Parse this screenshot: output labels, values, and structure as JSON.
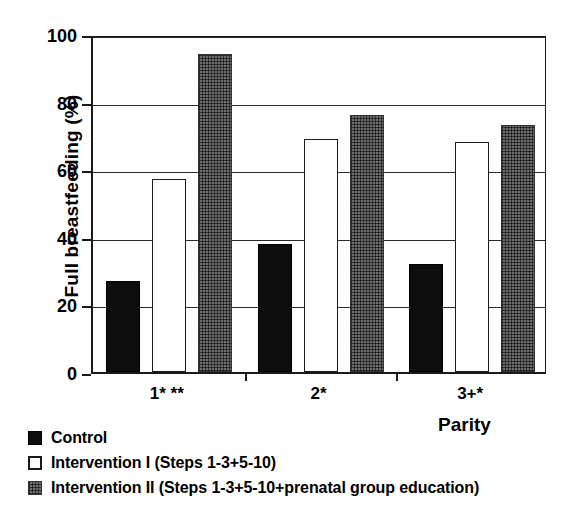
{
  "chart_data": {
    "type": "bar",
    "title": "",
    "xlabel": "Parity",
    "ylabel": "Full breastfeeding (%)",
    "ylim": [
      0,
      100
    ],
    "yticks": [
      0,
      20,
      40,
      60,
      80,
      100
    ],
    "ytick_labels": [
      "0",
      "20",
      "40",
      "60",
      "80",
      "100"
    ],
    "grid": true,
    "legend_position": "bottom-left",
    "categories": [
      "1* **",
      "2*",
      "3+*"
    ],
    "series": [
      {
        "name": "Control",
        "swatch": "solid-black",
        "color": "#0d0d0d",
        "values": [
          27,
          38,
          32
        ]
      },
      {
        "name": "Intervention I (Steps 1-3+5-10)",
        "swatch": "white-outline",
        "color": "#ffffff",
        "values": [
          57,
          69,
          68
        ]
      },
      {
        "name": "Intervention II (Steps 1-3+5-10+prenatal group education)",
        "swatch": "gray-crosshatch",
        "color": "#6e6e6e",
        "values": [
          94,
          76,
          73
        ]
      }
    ]
  },
  "axis": {
    "y_title": "Full breastfeeding (%)",
    "x_title": "Parity"
  }
}
